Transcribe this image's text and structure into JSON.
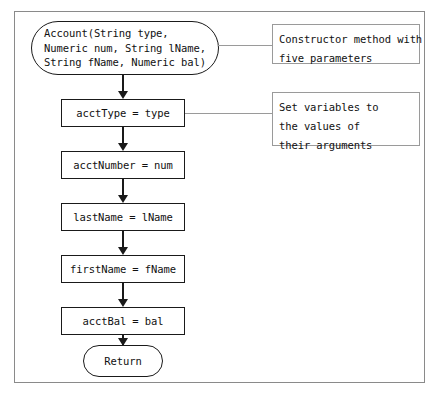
{
  "figure": {
    "background": "#ffffff",
    "frame_color": "#8a8a8a",
    "shape_color": "#1a1a1a",
    "annotation_color": "#9a9a9a"
  },
  "flow": {
    "start": {
      "shape": "terminal",
      "text": "Account(String type,\nNumeric num, String lName,\nString fName, Numeric bal)"
    },
    "steps": [
      {
        "shape": "process",
        "text": "acctType = type"
      },
      {
        "shape": "process",
        "text": "acctNumber = num"
      },
      {
        "shape": "process",
        "text": "lastName = lName"
      },
      {
        "shape": "process",
        "text": "firstName = fName"
      },
      {
        "shape": "process",
        "text": "acctBal = bal"
      }
    ],
    "end": {
      "shape": "terminal",
      "text": "Return"
    }
  },
  "annotations": [
    {
      "text": "Constructor method with\nfive parameters",
      "target": "start"
    },
    {
      "text": "Set variables to\nthe values of\ntheir arguments",
      "target": "acctType = type"
    }
  ]
}
